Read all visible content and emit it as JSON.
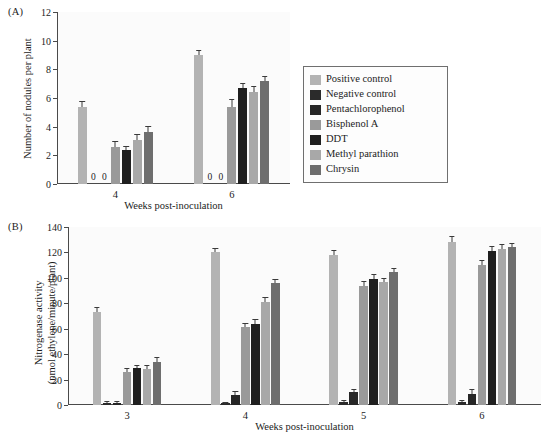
{
  "figure": {
    "panel_a_letter": "(A)",
    "panel_b_letter": "(B)"
  },
  "legend": {
    "items": [
      {
        "label": "Positive control",
        "color": "#b3b3b3"
      },
      {
        "label": "Negative control",
        "color": "#2b2b2b"
      },
      {
        "label": "Pentachlorophenol",
        "color": "#262626"
      },
      {
        "label": "Bisphenol A",
        "color": "#9a9a9a"
      },
      {
        "label": "DDT",
        "color": "#1f1f1f"
      },
      {
        "label": "Methyl parathion",
        "color": "#a8a8a8"
      },
      {
        "label": "Chrysin",
        "color": "#6e6e6e"
      }
    ]
  },
  "chart_data": [
    {
      "type": "bar",
      "panel": "A",
      "title": "",
      "xlabel": "Weeks post-inoculation",
      "ylabel": "Number of nodules per plant",
      "ylim": [
        0,
        12
      ],
      "yticks": [
        0,
        2,
        4,
        6,
        8,
        10,
        12
      ],
      "ytick_labels": [
        "0",
        "2",
        "4",
        "6",
        "8",
        "10",
        "12"
      ],
      "grid": false,
      "categories": [
        "4",
        "6"
      ],
      "series": [
        {
          "name": "Positive control",
          "color": "#b3b3b3",
          "values": [
            5.4,
            9.0
          ],
          "errors": [
            0.35,
            0.3
          ]
        },
        {
          "name": "Negative control",
          "color": "#2b2b2b",
          "values": [
            0,
            0
          ],
          "errors": [
            0,
            0
          ],
          "zero_label": "0"
        },
        {
          "name": "Pentachlorophenol",
          "color": "#262626",
          "values": [
            0,
            0
          ],
          "errors": [
            0,
            0
          ],
          "zero_label": "0"
        },
        {
          "name": "Bisphenol A",
          "color": "#9a9a9a",
          "values": [
            2.55,
            5.4
          ],
          "errors": [
            0.35,
            0.45
          ]
        },
        {
          "name": "DDT",
          "color": "#1f1f1f",
          "values": [
            2.35,
            6.7
          ],
          "errors": [
            0.25,
            0.3
          ]
        },
        {
          "name": "Methyl parathion",
          "color": "#a8a8a8",
          "values": [
            3.1,
            6.45
          ],
          "errors": [
            0.35,
            0.35
          ]
        },
        {
          "name": "Chrysin",
          "color": "#6e6e6e",
          "values": [
            3.6,
            7.2
          ],
          "errors": [
            0.35,
            0.25
          ]
        }
      ]
    },
    {
      "type": "bar",
      "panel": "B",
      "title": "",
      "xlabel": "Weeks post-inoculation",
      "ylabel_line1": "Nitrogenase activity",
      "ylabel_line2": "(nmol ethylene/minute/plant)",
      "ylim": [
        0,
        140
      ],
      "yticks": [
        0,
        20,
        40,
        60,
        80,
        100,
        120,
        140
      ],
      "ytick_labels": [
        "0",
        "20",
        "40",
        "60",
        "80",
        "100",
        "120",
        "140"
      ],
      "grid": false,
      "categories": [
        "3",
        "4",
        "5",
        "6"
      ],
      "series": [
        {
          "name": "Positive control",
          "color": "#b3b3b3",
          "values": [
            73,
            120,
            118,
            128
          ],
          "errors": [
            3,
            3,
            3,
            4
          ]
        },
        {
          "name": "Negative control",
          "color": "#2b2b2b",
          "values": [
            1.5,
            1.2,
            2,
            2
          ],
          "errors": [
            0.8,
            0.6,
            0.8,
            0.8
          ]
        },
        {
          "name": "Pentachlorophenol",
          "color": "#262626",
          "values": [
            1.5,
            8,
            10,
            9
          ],
          "errors": [
            0.8,
            2,
            2,
            2.5
          ]
        },
        {
          "name": "Bisphenol A",
          "color": "#9a9a9a",
          "values": [
            26,
            61,
            94,
            110
          ],
          "errors": [
            2,
            3,
            2.5,
            3
          ]
        },
        {
          "name": "DDT",
          "color": "#1f1f1f",
          "values": [
            29,
            64,
            99,
            121
          ],
          "errors": [
            1.5,
            3,
            3,
            3
          ]
        },
        {
          "name": "Methyl parathion",
          "color": "#a8a8a8",
          "values": [
            28,
            81,
            97,
            123
          ],
          "errors": [
            2.5,
            3,
            2.5,
            3
          ]
        },
        {
          "name": "Chrysin",
          "color": "#6e6e6e",
          "values": [
            34,
            96,
            105,
            124
          ],
          "errors": [
            3,
            2.5,
            2,
            3
          ]
        }
      ]
    }
  ]
}
